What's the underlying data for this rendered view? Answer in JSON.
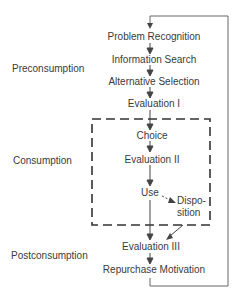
{
  "diagram": {
    "phases": {
      "preconsumption": "Preconsumption",
      "consumption": "Consumption",
      "postconsumption": "Postconsumption"
    },
    "steps": {
      "problem_recognition": "Problem Recognition",
      "information_search": "Information Search",
      "alternative_selection": "Alternative Selection",
      "evaluation_1": "Evaluation I",
      "choice": "Choice",
      "evaluation_2": "Evaluation II",
      "use": "Use",
      "disposition_line1": "Dispo-",
      "disposition_line2": "sition",
      "evaluation_3": "Evaluation III",
      "repurchase_motivation": "Repurchase Motivation"
    },
    "colors": {
      "line": "#555555",
      "text": "#3a3a3a",
      "background": "#ffffff"
    }
  }
}
